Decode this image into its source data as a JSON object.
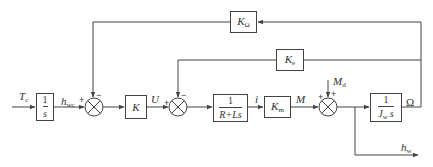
{
  "diagram": {
    "type": "control block diagram",
    "signals": {
      "input": "T",
      "input_sub": "c",
      "h_wc": "h",
      "h_wc_sub": "wc",
      "u": "U",
      "i": "i",
      "m": "M",
      "m_d": "M",
      "m_d_sub": "d",
      "omega": "Ω",
      "h_w": "h",
      "h_w_sub": "w"
    },
    "blocks": {
      "integrator": {
        "num": "1",
        "den": "s"
      },
      "gain_k": {
        "label": "K"
      },
      "electrical": {
        "num": "1",
        "den": "R+Ls"
      },
      "torque_const": {
        "label": "K",
        "sub": "m"
      },
      "inertia": {
        "num": "1",
        "den": "J",
        "den_sub": "w",
        "den_tail": "s"
      },
      "speed_feedback": {
        "label": "K",
        "sub": "Ω"
      },
      "back_emf": {
        "label": "K",
        "sub": "e"
      }
    },
    "summers": {
      "s1": {
        "left": "+",
        "top": "−"
      },
      "s2": {
        "left": "+",
        "top": "−"
      },
      "s3": {
        "left": "+",
        "top": "+"
      }
    },
    "colors": {
      "line": "#444444",
      "text": "#333333",
      "background": "#ffffff"
    }
  }
}
